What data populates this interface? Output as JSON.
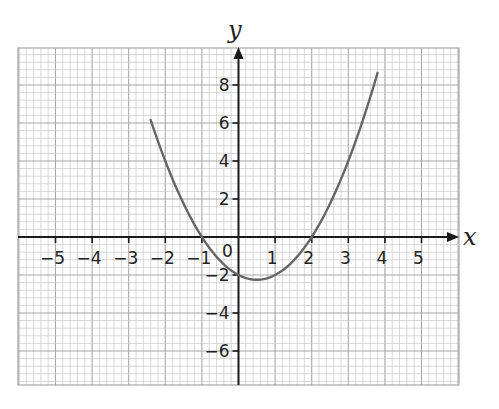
{
  "chart_data": {
    "type": "line",
    "title": "",
    "xlabel": "x",
    "ylabel": "y",
    "equation": "y = x^2 - x - 2",
    "xlim": [
      -6.0,
      6.0
    ],
    "ylim": [
      -7.8,
      10.0
    ],
    "x_ticks": [
      -5,
      -4,
      -3,
      -2,
      -1,
      1,
      2,
      3,
      4,
      5
    ],
    "x_tick_labels": [
      "−5",
      "−4",
      "−3",
      "−2",
      "−1",
      "1",
      "2",
      "3",
      "4",
      "5"
    ],
    "y_ticks": [
      8,
      6,
      4,
      2,
      -2,
      -4,
      -6
    ],
    "y_tick_labels": [
      "8",
      "6",
      "4",
      "2",
      "−2",
      "−4",
      "−6"
    ],
    "origin_label": "0",
    "grid": true,
    "grid_minor_per_x_unit": 5,
    "grid_minor_per_2_y_units": 5,
    "series": [
      {
        "name": "y = x² − x − 2",
        "x_range": [
          -2.4,
          3.8
        ],
        "x": [
          -2.4,
          -2,
          -1.5,
          -1,
          -0.5,
          0,
          0.5,
          1,
          1.5,
          2,
          2.5,
          3,
          3.5,
          3.8
        ],
        "y": [
          6.16,
          4,
          1.75,
          0,
          -1.25,
          -2,
          -2.25,
          -2,
          -1.25,
          0,
          1.75,
          4,
          6.75,
          8.64
        ],
        "roots": [
          -1,
          2
        ],
        "y_intercept": -2,
        "vertex": [
          0.5,
          -2.25
        ]
      }
    ]
  },
  "colors": {
    "grid_minor": "#c8c8c8",
    "grid_major": "#a8a8a8",
    "axis": "#1a1a1a",
    "curve": "#666666",
    "background": "#ffffff"
  },
  "labels": {
    "x_axis": "x",
    "y_axis": "y",
    "origin": "0"
  }
}
